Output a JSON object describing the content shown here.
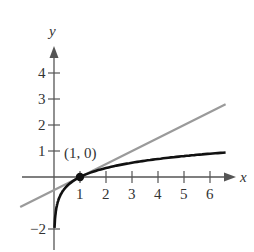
{
  "chart_data": {
    "type": "line",
    "title": "",
    "xlabel": "x",
    "ylabel": "y",
    "x_ticks": [
      "1",
      "2",
      "3",
      "4",
      "5",
      "6"
    ],
    "y_ticks": [
      "-2",
      "1",
      "2",
      "3",
      "4"
    ],
    "xlim": [
      -1.3,
      6.8
    ],
    "ylim": [
      -2.5,
      4.6
    ],
    "grid": false,
    "series": [
      {
        "name": "curve",
        "description": "logarithmic curve, f(x) ≈ (1/2) ln x",
        "color": "#111111",
        "x": [
          0.02,
          0.05,
          0.1,
          0.2,
          0.4,
          0.7,
          1,
          1.5,
          2,
          3,
          4,
          5,
          6,
          6.6
        ],
        "y": [
          -1.96,
          -1.5,
          -1.15,
          -0.8,
          -0.46,
          -0.18,
          0,
          0.2,
          0.35,
          0.55,
          0.69,
          0.8,
          0.9,
          0.94
        ]
      },
      {
        "name": "tangent line",
        "description": "tangent at (1, 0), slope ≈ 1/2",
        "color": "#999999",
        "x": [
          -1.3,
          6.6
        ],
        "y": [
          -1.15,
          2.8
        ]
      }
    ],
    "annotations": [
      {
        "text": "(1, 0)",
        "x": 1,
        "y": 0,
        "marker": "filled-dot"
      }
    ]
  }
}
